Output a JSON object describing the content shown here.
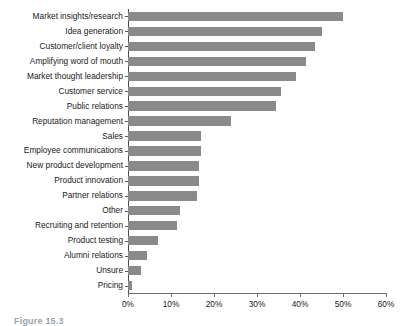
{
  "chart_data": {
    "type": "bar",
    "orientation": "horizontal",
    "title": "",
    "xlabel": "",
    "ylabel": "",
    "xlim": [
      0,
      60
    ],
    "xticks": [
      0,
      10,
      20,
      30,
      40,
      50,
      60
    ],
    "xtick_labels": [
      "0%",
      "10%",
      "20%",
      "30%",
      "40%",
      "50%",
      "60%"
    ],
    "grid": false,
    "legend": null,
    "bar_color": "#8a8a8a",
    "value_unit": "%",
    "categories": [
      "Market insights/research",
      "Idea generation",
      "Customer/client loyalty",
      "Amplifying word of mouth",
      "Market thought leadership",
      "Customer service",
      "Public relations",
      "Reputation management",
      "Sales",
      "Employee communications",
      "New product development",
      "Product innovation",
      "Partner relations",
      "Other",
      "Recruiting and retention",
      "Product testing",
      "Alumni relations",
      "Unsure",
      "Pricing"
    ],
    "values": [
      50,
      45,
      43.5,
      41.5,
      39,
      35.5,
      34.5,
      24,
      17,
      17,
      16.5,
      16.5,
      16,
      12,
      11.5,
      7,
      4.5,
      3,
      1
    ]
  },
  "caption": {
    "figure_label": "Figure 15.3",
    "figure_text": ""
  }
}
